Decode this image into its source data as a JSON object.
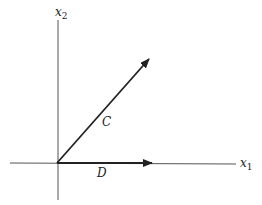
{
  "diagram": {
    "axes": {
      "x_label": "x",
      "x_sub": "1",
      "y_label": "x",
      "y_sub": "2"
    },
    "vectors": [
      {
        "name": "C",
        "label": "C",
        "from": [
          57,
          163
        ],
        "to": [
          149,
          59
        ]
      },
      {
        "name": "D",
        "label": "D",
        "from": [
          57,
          163
        ],
        "to": [
          152,
          163
        ]
      }
    ],
    "colors": {
      "line": "#222222",
      "axis": "#555555"
    }
  }
}
